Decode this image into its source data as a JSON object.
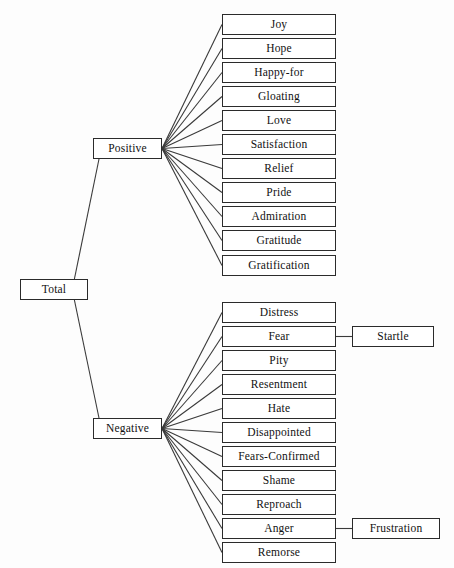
{
  "diagram": {
    "type": "tree",
    "title": "",
    "orientation": "left-to-right",
    "root": {
      "label": "Total",
      "x": 20,
      "y": 279,
      "w": 68,
      "h": 21
    },
    "branches": [
      {
        "label": "Positive",
        "x": 93,
        "y": 138,
        "w": 69,
        "h": 21
      },
      {
        "label": "Negative",
        "x": 93,
        "y": 418,
        "w": 69,
        "h": 21
      }
    ],
    "positive_leaves": [
      {
        "label": "Joy",
        "x": 222,
        "y": 14,
        "w": 114,
        "h": 21
      },
      {
        "label": "Hope",
        "x": 222,
        "y": 38,
        "w": 114,
        "h": 21
      },
      {
        "label": "Happy-for",
        "x": 222,
        "y": 62,
        "w": 114,
        "h": 21
      },
      {
        "label": "Gloating",
        "x": 222,
        "y": 86,
        "w": 114,
        "h": 21
      },
      {
        "label": "Love",
        "x": 222,
        "y": 110,
        "w": 114,
        "h": 21
      },
      {
        "label": "Satisfaction",
        "x": 222,
        "y": 134,
        "w": 114,
        "h": 21
      },
      {
        "label": "Relief",
        "x": 222,
        "y": 158,
        "w": 114,
        "h": 21
      },
      {
        "label": "Pride",
        "x": 222,
        "y": 182,
        "w": 114,
        "h": 21
      },
      {
        "label": "Admiration",
        "x": 222,
        "y": 206,
        "w": 114,
        "h": 21
      },
      {
        "label": "Gratitude",
        "x": 222,
        "y": 230,
        "w": 114,
        "h": 21
      },
      {
        "label": "Gratification",
        "x": 222,
        "y": 255,
        "w": 114,
        "h": 21
      }
    ],
    "negative_leaves": [
      {
        "label": "Distress",
        "x": 222,
        "y": 302,
        "w": 114,
        "h": 21
      },
      {
        "label": "Fear",
        "x": 222,
        "y": 326,
        "w": 114,
        "h": 21
      },
      {
        "label": "Pity",
        "x": 222,
        "y": 350,
        "w": 114,
        "h": 21
      },
      {
        "label": "Resentment",
        "x": 222,
        "y": 374,
        "w": 114,
        "h": 21
      },
      {
        "label": "Hate",
        "x": 222,
        "y": 398,
        "w": 114,
        "h": 21
      },
      {
        "label": "Disappointed",
        "x": 222,
        "y": 422,
        "w": 114,
        "h": 21
      },
      {
        "label": "Fears-Confirmed",
        "x": 222,
        "y": 446,
        "w": 114,
        "h": 21
      },
      {
        "label": "Shame",
        "x": 222,
        "y": 470,
        "w": 114,
        "h": 21
      },
      {
        "label": "Reproach",
        "x": 222,
        "y": 494,
        "w": 114,
        "h": 21
      },
      {
        "label": "Anger",
        "x": 222,
        "y": 518,
        "w": 114,
        "h": 21
      },
      {
        "label": "Remorse",
        "x": 222,
        "y": 542,
        "w": 114,
        "h": 21
      }
    ],
    "sub_leaves": [
      {
        "label": "Startle",
        "parent": "Fear",
        "x": 352,
        "y": 326,
        "w": 82,
        "h": 21
      },
      {
        "label": "Frustration",
        "parent": "Anger",
        "x": 352,
        "y": 518,
        "w": 88,
        "h": 21
      }
    ],
    "edge_color": "#3a3a3a",
    "box_border_color": "#2b2b2b",
    "background_color": "#fdfdfd"
  }
}
